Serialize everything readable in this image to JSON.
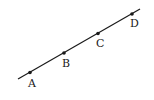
{
  "diagram": {
    "type": "collinear-points-on-line",
    "line": {
      "x1": 18,
      "y1": 79,
      "x2": 140,
      "y2": 9,
      "color": "#1a1a1a"
    },
    "points": [
      {
        "label": "A",
        "x": 30,
        "y": 72.5,
        "lx": 28,
        "ly": 87
      },
      {
        "label": "B",
        "x": 64,
        "y": 53,
        "lx": 62,
        "ly": 67
      },
      {
        "label": "C",
        "x": 98,
        "y": 33.5,
        "lx": 96,
        "ly": 47
      },
      {
        "label": "D",
        "x": 132,
        "y": 14,
        "lx": 130,
        "ly": 27
      }
    ]
  }
}
